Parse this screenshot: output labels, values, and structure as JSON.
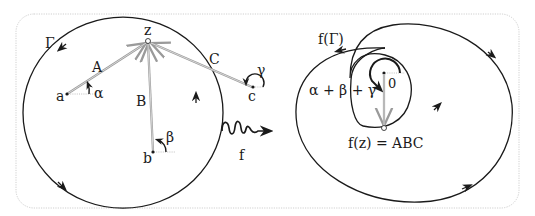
{
  "colors": {
    "ink": "#1a1a1a",
    "vector": "#9a9a9a",
    "frame": "#cfcfcf",
    "background": "#ffffff"
  },
  "left_panel": {
    "curve_label": "Γ",
    "point_z": "z",
    "points": [
      {
        "name": "a",
        "angle": "α",
        "vector": "A"
      },
      {
        "name": "b",
        "angle": "β",
        "vector": "B"
      },
      {
        "name": "c",
        "angle": "γ",
        "vector": "C"
      }
    ]
  },
  "map": {
    "label": "f",
    "icon": "squiggle-arrow-icon"
  },
  "right_panel": {
    "curve_label": "f(Γ)",
    "origin_label": "0",
    "angle_sum_label": "α + β + γ",
    "image_point_label": "f(z) = ABC"
  }
}
